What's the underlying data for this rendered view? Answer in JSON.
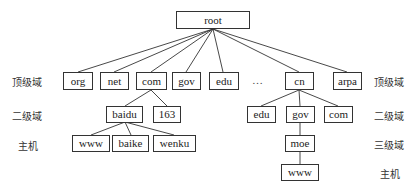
{
  "diagram": {
    "type": "DNS domain name tree",
    "root": "root",
    "top_level": [
      "org",
      "net",
      "com",
      "gov",
      "edu",
      "…",
      "cn",
      "arpa"
    ],
    "com_children": [
      "baidu",
      "163"
    ],
    "baidu_children": [
      "www",
      "baike",
      "wenku"
    ],
    "cn_children": [
      "edu",
      "gov",
      "com"
    ],
    "gov_children": [
      "moe"
    ],
    "moe_children": [
      "www"
    ],
    "left_labels": [
      "顶级域",
      "二级域",
      "主机"
    ],
    "right_labels": [
      "顶级域",
      "二级域",
      "三级域",
      "主机"
    ]
  },
  "nodes": {
    "root": "root",
    "org": "org",
    "net": "net",
    "com": "com",
    "gov": "gov",
    "edu": "edu",
    "ellipsis": "…",
    "cn": "cn",
    "arpa": "arpa",
    "baidu": "baidu",
    "n163": "163",
    "www1": "www",
    "baike": "baike",
    "wenku": "wenku",
    "cn_edu": "edu",
    "cn_gov": "gov",
    "cn_com": "com",
    "moe": "moe",
    "www2": "www"
  },
  "labels": {
    "left_tld": "顶级域",
    "left_sld": "二级域",
    "left_host": "主机",
    "right_tld": "顶级域",
    "right_sld": "二级域",
    "right_3ld": "三级域",
    "right_host": "主机"
  }
}
